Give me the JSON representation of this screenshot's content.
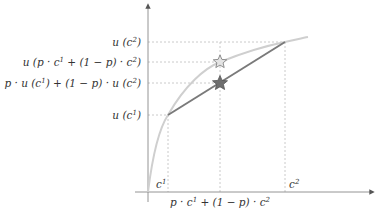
{
  "diagram": {
    "colors": {
      "axis": "#888888",
      "curve": "#cfcfcf",
      "chord": "#7a7a7a",
      "guide": "#bdbdbd",
      "star_utility_of_expectation_fill": "#e4e4e4",
      "star_expected_utility_fill": "#6e6e6e",
      "text": "#333333"
    },
    "y_labels": {
      "u_c2": "u (c²)",
      "u_mean": "u (p · c¹ + (1 − p) · c²)",
      "expected_u": "p · u (c¹) + (1 − p) · u (c²)",
      "u_c1": "u (c¹)"
    },
    "x_labels": {
      "c1": "c¹",
      "c2": "c²",
      "mean": "p · c¹ + (1 − p) · c²"
    },
    "markers": [
      {
        "name": "utility-of-expected-value",
        "style": "hollow-star"
      },
      {
        "name": "expected-utility",
        "style": "filled-star"
      }
    ]
  }
}
